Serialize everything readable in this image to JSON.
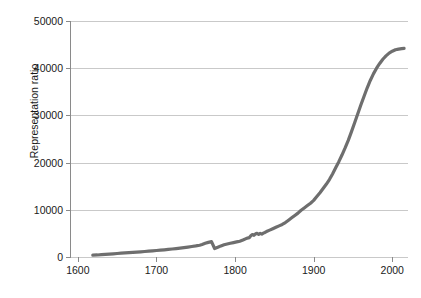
{
  "chart_data": {
    "type": "line",
    "title": "",
    "xlabel": "",
    "ylabel": "Representation ratio",
    "xlim": [
      1590,
      2020
    ],
    "ylim": [
      0,
      50000
    ],
    "grid": true,
    "legend": null,
    "xticks": [
      1600,
      1700,
      1800,
      1900,
      2000
    ],
    "xtick_labels": [
      "1600",
      "1700",
      "1800",
      "1900",
      "2000"
    ],
    "yticks": [
      0,
      10000,
      20000,
      30000,
      40000,
      50000
    ],
    "ytick_labels": [
      "0",
      "10000",
      "20000",
      "30000",
      "40000",
      "50000"
    ],
    "series": [
      {
        "name": "Representation ratio",
        "color": "#6e6e6e",
        "linewidth": 3.2,
        "x": [
          1619,
          1625,
          1630,
          1635,
          1640,
          1645,
          1650,
          1655,
          1660,
          1665,
          1670,
          1675,
          1680,
          1685,
          1690,
          1695,
          1700,
          1705,
          1710,
          1715,
          1720,
          1725,
          1730,
          1735,
          1740,
          1745,
          1750,
          1755,
          1758,
          1762,
          1766,
          1770,
          1774,
          1778,
          1782,
          1786,
          1790,
          1794,
          1798,
          1802,
          1806,
          1810,
          1814,
          1818,
          1820,
          1822,
          1824,
          1826,
          1828,
          1830,
          1832,
          1834,
          1836,
          1838,
          1840,
          1844,
          1848,
          1852,
          1856,
          1860,
          1864,
          1868,
          1872,
          1876,
          1880,
          1884,
          1888,
          1892,
          1896,
          1900,
          1904,
          1908,
          1912,
          1916,
          1920,
          1924,
          1928,
          1932,
          1936,
          1940,
          1944,
          1948,
          1952,
          1956,
          1960,
          1964,
          1968,
          1972,
          1976,
          1980,
          1984,
          1988,
          1992,
          1996,
          2000,
          2004,
          2008,
          2012,
          2015
        ],
        "y": [
          380,
          430,
          500,
          560,
          620,
          680,
          740,
          800,
          860,
          920,
          980,
          1040,
          1100,
          1160,
          1230,
          1300,
          1380,
          1450,
          1520,
          1600,
          1690,
          1780,
          1880,
          1990,
          2100,
          2220,
          2350,
          2500,
          2650,
          2900,
          3100,
          3250,
          1800,
          2050,
          2350,
          2600,
          2750,
          2900,
          3050,
          3200,
          3350,
          3600,
          3900,
          4100,
          4500,
          4750,
          4600,
          4900,
          5000,
          4800,
          5000,
          4850,
          5050,
          5200,
          5400,
          5700,
          6000,
          6300,
          6600,
          6900,
          7300,
          7800,
          8300,
          8800,
          9300,
          9900,
          10400,
          10900,
          11400,
          12000,
          12800,
          13600,
          14500,
          15400,
          16400,
          17600,
          18900,
          20200,
          21600,
          23100,
          24700,
          26500,
          28400,
          30300,
          32200,
          34000,
          35800,
          37400,
          38800,
          40000,
          41000,
          41900,
          42600,
          43200,
          43600,
          43900,
          44050,
          44150,
          44200
        ]
      }
    ],
    "dip": {
      "year": 1774,
      "value": 1800,
      "note": "sharp drop near 1774"
    }
  },
  "figure": {
    "background": "#ffffff",
    "grid_color": "#c9c9c9",
    "axis_color": "#8a8a8a",
    "text_color": "#1a1a1a"
  }
}
